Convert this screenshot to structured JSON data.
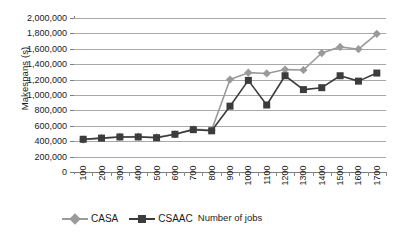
{
  "chart_data": {
    "type": "line",
    "title": "",
    "xlabel": "Number of jobs",
    "ylabel": "Makespans (s)",
    "categories": [
      100,
      200,
      300,
      400,
      500,
      600,
      700,
      800,
      900,
      1000,
      1100,
      1200,
      1300,
      1400,
      1500,
      1600,
      1700
    ],
    "x_tick_labels": [
      "100",
      "200",
      "300",
      "400",
      "500",
      "600",
      "700",
      "800",
      "900",
      "1000",
      "1100",
      "1200",
      "1300",
      "1400",
      "1500",
      "1600",
      "1700"
    ],
    "y_tick_labels": [
      "0",
      "200,000",
      "400,000",
      "600,000",
      "800,000",
      "1,000,000",
      "1,200,000",
      "1,400,000",
      "1,600,000",
      "1,800,000",
      "2,000,000"
    ],
    "y_tick_values": [
      0,
      200000,
      400000,
      600000,
      800000,
      1000000,
      1200000,
      1400000,
      1600000,
      1800000,
      2000000
    ],
    "ylim": [
      0,
      2000000
    ],
    "grid": "horizontal",
    "legend_position": "bottom-left",
    "series": [
      {
        "name": "CASA",
        "color": "#9a9a9a",
        "marker": "diamond",
        "values": [
          420000,
          440000,
          455000,
          460000,
          450000,
          490000,
          555000,
          545000,
          1200000,
          1290000,
          1280000,
          1330000,
          1325000,
          1545000,
          1625000,
          1595000,
          1795000
        ]
      },
      {
        "name": "CSAAC",
        "color": "#3c3c3c",
        "marker": "square",
        "values": [
          425000,
          440000,
          455000,
          455000,
          445000,
          490000,
          550000,
          535000,
          855000,
          1190000,
          870000,
          1250000,
          1070000,
          1095000,
          1250000,
          1180000,
          1285000
        ]
      }
    ]
  },
  "legend": {
    "items": [
      {
        "label": "CASA"
      },
      {
        "label": "CSAAC"
      }
    ]
  },
  "colors": {
    "series_casa": "#9a9a9a",
    "series_csaac": "#3c3c3c",
    "gridline": "#a8a8a8",
    "axis": "#7d7d7d",
    "background": "#ffffff",
    "text": "#1a1a1a"
  }
}
